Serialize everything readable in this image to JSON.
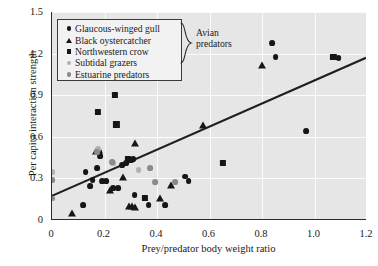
{
  "chart_data": {
    "type": "scatter",
    "title": "",
    "xlabel": "Prey/predator body weight ratio",
    "ylabel": "Per capita interaction strength",
    "xlim": [
      0,
      1.2
    ],
    "ylim": [
      0,
      1.5
    ],
    "xticks": [
      "0",
      "0.2",
      "0.4",
      "0.6",
      "0.8",
      "1.0",
      "1.2"
    ],
    "xtick_values": [
      0,
      0.2,
      0.4,
      0.6,
      0.8,
      1.0,
      1.2
    ],
    "yticks": [
      "0",
      "0.3",
      "0.6",
      "0.9",
      "1.2",
      "1.5"
    ],
    "ytick_values": [
      0,
      0.3,
      0.6,
      0.9,
      1.2,
      1.5
    ],
    "grid": true,
    "legend_position": "top-left",
    "legend_group_label": "Avian predators",
    "series": [
      {
        "name": "Glaucous-winged gull",
        "marker": "circle",
        "color": "#161616",
        "points": [
          [
            0.118,
            0.105
          ],
          [
            0.128,
            0.345
          ],
          [
            0.145,
            0.247
          ],
          [
            0.155,
            0.288
          ],
          [
            0.172,
            0.377
          ],
          [
            0.178,
            0.487
          ],
          [
            0.183,
            0.463
          ],
          [
            0.19,
            0.283
          ],
          [
            0.205,
            0.283
          ],
          [
            0.232,
            0.232
          ],
          [
            0.252,
            0.232
          ],
          [
            0.268,
            0.395
          ],
          [
            0.283,
            0.413
          ],
          [
            0.3,
            0.432
          ],
          [
            0.308,
            0.438
          ],
          [
            0.315,
            0.182
          ],
          [
            0.368,
            0.105
          ],
          [
            0.432,
            0.105
          ],
          [
            0.508,
            0.313
          ],
          [
            0.52,
            0.283
          ],
          [
            0.838,
            1.275
          ],
          [
            0.852,
            1.175
          ],
          [
            0.968,
            0.64
          ],
          [
            1.092,
            1.17
          ]
        ]
      },
      {
        "name": "Black oystercatcher",
        "marker": "triangle",
        "color": "#161616",
        "points": [
          [
            0.077,
            0.04
          ],
          [
            0.168,
            0.492
          ],
          [
            0.178,
            0.497
          ],
          [
            0.222,
            0.207
          ],
          [
            0.27,
            0.305
          ],
          [
            0.292,
            0.095
          ],
          [
            0.305,
            0.095
          ],
          [
            0.315,
            0.088
          ],
          [
            0.318,
            0.545
          ],
          [
            0.412,
            0.155
          ],
          [
            0.452,
            0.247
          ],
          [
            0.575,
            0.675
          ],
          [
            0.8,
            1.107
          ]
        ]
      },
      {
        "name": "Northwestern crow",
        "marker": "square",
        "color": "#161616",
        "points": [
          [
            0.175,
            0.78
          ],
          [
            0.24,
            0.9
          ],
          [
            0.245,
            0.69
          ],
          [
            0.288,
            0.438
          ],
          [
            0.355,
            0.157
          ],
          [
            0.652,
            0.412
          ],
          [
            1.072,
            1.175
          ]
        ]
      },
      {
        "name": "Subtidal grazers",
        "marker": "circle",
        "color": "#b2b2b2",
        "points": [
          [
            0.0,
            0.345
          ],
          [
            0.175,
            0.512
          ],
          [
            0.232,
            0.408
          ],
          [
            0.33,
            0.36
          ]
        ]
      },
      {
        "name": "Estuarine predators",
        "marker": "circle",
        "color": "#8a8a8a",
        "points": [
          [
            0.0,
            0.288
          ],
          [
            0.0,
            0.155
          ],
          [
            0.172,
            0.487
          ],
          [
            0.228,
            0.42
          ],
          [
            0.375,
            0.372
          ],
          [
            0.392,
            0.272
          ],
          [
            0.47,
            0.272
          ]
        ]
      }
    ],
    "trendline": {
      "name": "regression-line",
      "color": "#1f1f1f",
      "x_start": 0.0,
      "y_start": 0.168,
      "x_end": 1.2,
      "y_end": 1.168
    }
  },
  "axes": {
    "x_title": "Prey/predator body weight ratio",
    "y_title": "Per capita interaction strength"
  },
  "legend": {
    "group_label_line1": "Avian",
    "group_label_line2": "predators",
    "items": [
      {
        "label": "Glaucous-winged gull",
        "marker": "circle",
        "color": "#161616"
      },
      {
        "label": "Black oystercatcher",
        "marker": "triangle",
        "color": "#161616"
      },
      {
        "label": "Northwestern crow",
        "marker": "square",
        "color": "#161616"
      },
      {
        "label": "Subtidal grazers",
        "marker": "circle",
        "color": "#b2b2b2"
      },
      {
        "label": "Estuarine predators",
        "marker": "circle",
        "color": "#8a8a8a"
      }
    ]
  },
  "colors": {
    "plot_background": "#e6e6e6",
    "gridline": "#fbfbfb",
    "axis": "#2b2b2b",
    "text": "#1a1a1a"
  }
}
